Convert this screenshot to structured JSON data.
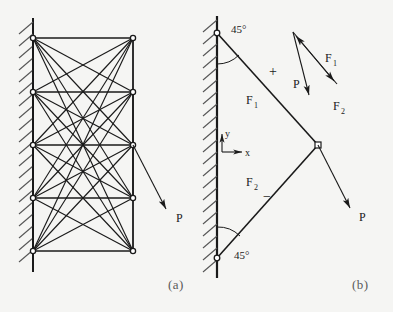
{
  "figure": {
    "background_color": "#f5f5f3",
    "ink_color": "#1a1a1a",
    "captions": {
      "left": "(a)",
      "right": "(b)"
    }
  },
  "panel_a": {
    "name": "ground-structure-truss",
    "description": "Fully connected ground structure truss attached to a hatched wall with applied load P",
    "load_label": "P",
    "support": "hatched-wall",
    "node_rows": 5,
    "node_columns": 2,
    "nodes": [
      {
        "id": "L1",
        "x": 33,
        "y": 38
      },
      {
        "id": "R1",
        "x": 133,
        "y": 38
      },
      {
        "id": "L2",
        "x": 33,
        "y": 92
      },
      {
        "id": "R2",
        "x": 133,
        "y": 92
      },
      {
        "id": "L3",
        "x": 33,
        "y": 145
      },
      {
        "id": "R3",
        "x": 133,
        "y": 145
      },
      {
        "id": "L4",
        "x": 33,
        "y": 198
      },
      {
        "id": "R4",
        "x": 133,
        "y": 198
      },
      {
        "id": "L5",
        "x": 33,
        "y": 251
      },
      {
        "id": "R5",
        "x": 133,
        "y": 251
      }
    ],
    "load_arrow": {
      "x1": 133,
      "y1": 145,
      "x2": 168,
      "y2": 213,
      "label": "P",
      "label_x": 177,
      "label_y": 221
    }
  },
  "panel_b": {
    "name": "optimal-two-bar-truss",
    "description": "Optimal two-bar truss with 45 degree members, coordinate axes, and force triangle",
    "support": "hatched-wall",
    "members": [
      {
        "id": "F1",
        "label": "F",
        "subscript": "1",
        "sign": "+",
        "from": {
          "x": 217,
          "y": 33
        },
        "to": {
          "x": 318,
          "y": 145
        }
      },
      {
        "id": "F2",
        "label": "F",
        "subscript": "2",
        "sign": "-",
        "from": {
          "x": 217,
          "y": 258
        },
        "to": {
          "x": 318,
          "y": 145
        }
      }
    ],
    "angles": [
      {
        "value": "45°",
        "at": "top-support",
        "x": 232,
        "y": 32
      },
      {
        "value": "45°",
        "at": "bottom-support",
        "x": 235,
        "y": 256
      }
    ],
    "axes": {
      "origin": {
        "x": 222,
        "y": 152
      },
      "x_label": "x",
      "y_label": "y"
    },
    "load_arrow": {
      "x1": 318,
      "y1": 145,
      "x2": 352,
      "y2": 212,
      "label": "P",
      "label_x": 360,
      "label_y": 220
    },
    "force_triangle": {
      "name": "force-polygon",
      "apex": {
        "x": 293,
        "y": 32
      },
      "p_tail": {
        "x": 310,
        "y": 98
      },
      "f2_tip": {
        "x": 337,
        "y": 84
      },
      "labels": [
        {
          "text": "F",
          "subscript": "1",
          "x": 328,
          "y": 58
        },
        {
          "text": "P",
          "subscript": "",
          "x": 296,
          "y": 84
        },
        {
          "text": "F",
          "subscript": "2",
          "x": 336,
          "y": 106
        }
      ]
    },
    "signs": [
      {
        "text": "+",
        "x": 272,
        "y": 70
      },
      {
        "text": "−",
        "x": 266,
        "y": 196
      }
    ]
  }
}
